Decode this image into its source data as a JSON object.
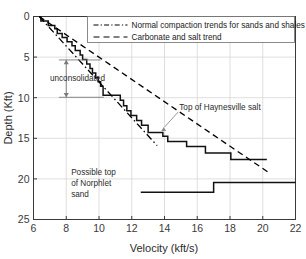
{
  "chart_data": {
    "type": "line",
    "title": "",
    "xlabel": "Velocity (kft/s)",
    "ylabel": "Depth (Kft)",
    "xlim": [
      6,
      22
    ],
    "ylim": [
      0,
      25
    ],
    "y_inverted": true,
    "grid": true,
    "xticks": [
      6,
      8,
      10,
      12,
      14,
      16,
      18,
      20,
      22
    ],
    "xtick_labels": [
      "6",
      "8",
      "10",
      "12",
      "14",
      "16",
      "18",
      "20",
      "22"
    ],
    "yticks": [
      0,
      5,
      10,
      15,
      20,
      25
    ],
    "ytick_labels": [
      "0",
      "5",
      "10",
      "15",
      "20",
      "25"
    ],
    "legend": {
      "position": "top-right",
      "entries": [
        {
          "label": "Normal compaction trends for sands and shales",
          "style": "dash-dot",
          "color": "#000000"
        },
        {
          "label": "Carbonate and salt trend",
          "style": "dashed",
          "color": "#000000"
        }
      ]
    },
    "series": [
      {
        "name": "velocity-depth-staircase",
        "style": "step-solid",
        "color": "#111111",
        "points": [
          [
            6.45,
            0.0
          ],
          [
            6.45,
            0.55
          ],
          [
            6.9,
            0.55
          ],
          [
            6.9,
            1.1
          ],
          [
            7.3,
            1.1
          ],
          [
            7.3,
            1.5
          ],
          [
            7.45,
            1.5
          ],
          [
            7.45,
            2.1
          ],
          [
            7.75,
            2.1
          ],
          [
            7.75,
            2.6
          ],
          [
            8.05,
            2.6
          ],
          [
            8.05,
            3.1
          ],
          [
            8.35,
            3.1
          ],
          [
            8.35,
            3.6
          ],
          [
            8.55,
            3.6
          ],
          [
            8.55,
            4.2
          ],
          [
            8.85,
            4.2
          ],
          [
            8.85,
            4.75
          ],
          [
            9.0,
            4.75
          ],
          [
            9.0,
            5.3
          ],
          [
            9.25,
            5.3
          ],
          [
            9.25,
            5.85
          ],
          [
            9.45,
            5.85
          ],
          [
            9.45,
            6.4
          ],
          [
            9.6,
            6.4
          ],
          [
            9.6,
            6.95
          ],
          [
            9.8,
            6.95
          ],
          [
            9.8,
            7.5
          ],
          [
            9.95,
            7.5
          ],
          [
            9.95,
            8.05
          ],
          [
            10.1,
            8.05
          ],
          [
            10.1,
            8.6
          ],
          [
            10.25,
            8.6
          ],
          [
            10.25,
            9.7
          ],
          [
            11.3,
            9.7
          ],
          [
            11.3,
            10.3
          ],
          [
            11.5,
            10.3
          ],
          [
            11.5,
            11.0
          ],
          [
            11.7,
            11.0
          ],
          [
            11.7,
            11.6
          ],
          [
            11.95,
            11.6
          ],
          [
            11.95,
            12.2
          ],
          [
            12.3,
            12.2
          ],
          [
            12.3,
            12.8
          ],
          [
            12.6,
            12.8
          ],
          [
            12.6,
            13.4
          ],
          [
            13.0,
            13.4
          ],
          [
            13.0,
            14.3
          ],
          [
            13.9,
            14.3
          ],
          [
            13.9,
            14.75
          ],
          [
            14.2,
            14.75
          ],
          [
            14.2,
            15.4
          ],
          [
            15.35,
            15.4
          ],
          [
            15.35,
            16.0
          ],
          [
            16.5,
            16.0
          ],
          [
            16.5,
            16.8
          ],
          [
            18.05,
            16.8
          ],
          [
            18.05,
            17.6
          ],
          [
            20.25,
            17.6
          ]
        ]
      },
      {
        "name": "normal-compaction-trend",
        "style": "dash-dot",
        "color": "#000000",
        "points": [
          [
            6.35,
            0.0
          ],
          [
            13.55,
            15.9
          ]
        ]
      },
      {
        "name": "carbonate-salt-trend",
        "style": "dashed",
        "color": "#000000",
        "points": [
          [
            6.35,
            0.0
          ],
          [
            20.35,
            19.2
          ]
        ]
      },
      {
        "name": "norphlet-step",
        "style": "step-solid",
        "color": "#111111",
        "points": [
          [
            12.55,
            21.65
          ],
          [
            17.0,
            21.65
          ],
          [
            17.0,
            20.45
          ],
          [
            22.0,
            20.45
          ]
        ]
      }
    ],
    "annotations": [
      {
        "name": "unconsolidated",
        "text": "unconsolidated",
        "text_x": 7.0,
        "text_y": 8.0,
        "arrow_x": 8.0,
        "arrow_y_top": 5.35,
        "arrow_y_bottom": 9.95,
        "bracket_top_x": [
          7.55,
          10.1
        ],
        "bracket_bottom_x": [
          7.55,
          10.3
        ],
        "color": "#7a7a7a"
      },
      {
        "name": "top-of-haynesville-salt",
        "text": "Top of Haynesville salt",
        "text_x": 14.9,
        "text_y": 11.5,
        "point_x": 13.95,
        "point_y": 13.6,
        "color": "#8a8a8a"
      },
      {
        "name": "possible-top-of-norphlet-sand",
        "lines": [
          "Possible top",
          "of Norphlet",
          "sand"
        ],
        "text_x": 8.3,
        "text_y": 19.5,
        "color": "#2b2b2b"
      }
    ]
  },
  "axes": {
    "x_title": "Velocity (kft/s)",
    "y_title": "Depth (Kft)"
  },
  "legend": {
    "entry_0": "Normal compaction trends for sands and shales",
    "entry_1": "Carbonate and salt trend"
  },
  "annotations": {
    "unconsolidated": "unconsolidated",
    "haynesville": "Top of Haynesville salt",
    "norphlet_line_0": "Possible top",
    "norphlet_line_1": "of Norphlet",
    "norphlet_line_2": "sand"
  },
  "ticks": {
    "x": [
      "6",
      "8",
      "10",
      "12",
      "14",
      "16",
      "18",
      "20",
      "22"
    ],
    "y": [
      "0",
      "5",
      "10",
      "15",
      "20",
      "25"
    ]
  },
  "colors": {
    "axis": "#3a3a3a",
    "grid": "#d6d6d6",
    "curve": "#111111",
    "annotation_gray": "#8a8a8a",
    "background": "#ffffff"
  }
}
